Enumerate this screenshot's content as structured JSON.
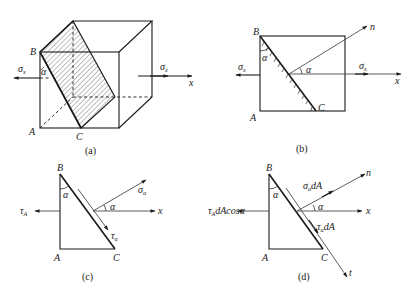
{
  "figure": {
    "panels": [
      {
        "id": "a",
        "caption": "(a)",
        "description": "Cube under uniaxial tension with inclined hatched section BC",
        "points": {
          "B": "B",
          "A": "A",
          "C": "C"
        },
        "angle": "α",
        "loads": {
          "left": {
            "sym": "σ",
            "sub": "x"
          },
          "right": {
            "sym": "σ",
            "sub": "x"
          }
        },
        "axis": "x"
      },
      {
        "id": "b",
        "caption": "(b)",
        "description": "Front view with inclined plane BC and its normal n",
        "points": {
          "B": "B",
          "A": "A",
          "C": "C"
        },
        "angle_top": "α",
        "angle_normal": "α",
        "normal": "n",
        "loads": {
          "left": {
            "sym": "σ",
            "sub": "x"
          },
          "right": {
            "sym": "σ",
            "sub": "x"
          }
        },
        "axis": "x"
      },
      {
        "id": "c",
        "caption": "(c)",
        "description": "Free body triangle ABC with stresses on inclined face",
        "points": {
          "B": "B",
          "A": "A",
          "C": "C"
        },
        "angle_top": "α",
        "angle_normal": "α",
        "left_stress": {
          "sym": "τ",
          "sub": "A"
        },
        "normal_stress": {
          "sym": "σ",
          "sub": "α"
        },
        "shear_stress": {
          "sym": "τ",
          "sub": "α"
        },
        "axis": "x"
      },
      {
        "id": "d",
        "caption": "(d)",
        "description": "Force equilibrium on triangle ABC",
        "points": {
          "B": "B",
          "A": "A",
          "C": "C"
        },
        "angle_top": "α",
        "angle_normal": "α",
        "left_force": {
          "sym": "τ",
          "sub": "A",
          "rest": "dAcosα"
        },
        "normal_force": {
          "sym": "σ",
          "sub": "α",
          "rest": "dA"
        },
        "shear_force": {
          "sym": "τ",
          "sub": "α",
          "rest": "dA"
        },
        "normal": "n",
        "tangent": "t",
        "axis": "x"
      }
    ]
  }
}
